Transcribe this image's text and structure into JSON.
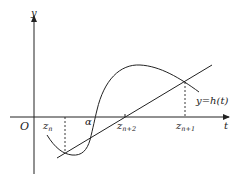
{
  "diagram": {
    "axes": {
      "x_label": "t",
      "y_label": "y",
      "origin_label": "O"
    },
    "curve_label": "y = h(t)",
    "curve_label_parts": {
      "lhs": "y",
      "eq": "=",
      "rhs": "h(t)"
    },
    "points": [
      {
        "id": "z_n",
        "base": "z",
        "sub": "n"
      },
      {
        "id": "alpha",
        "base": "α",
        "sub": ""
      },
      {
        "id": "z_n_plus_2",
        "base": "z",
        "sub": "n+2"
      },
      {
        "id": "z_n_plus_1",
        "base": "z",
        "sub": "n+1"
      }
    ],
    "colors": {
      "stroke": "#222222",
      "background": "#ffffff"
    }
  }
}
